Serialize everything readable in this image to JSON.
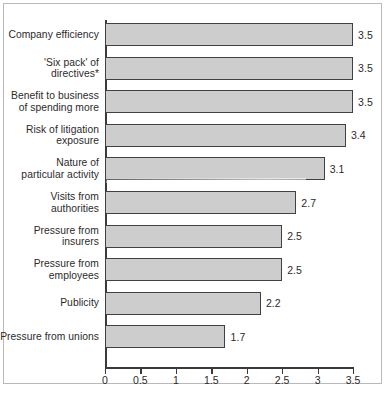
{
  "chart_data": {
    "type": "bar",
    "orientation": "horizontal",
    "title": "",
    "subtitle": "",
    "xlabel": "",
    "ylabel": "",
    "xlim": [
      0,
      3.5
    ],
    "xticks": [
      "0",
      "0.5",
      "1",
      "1.5",
      "2",
      "2.5",
      "3",
      "3.5"
    ],
    "xtick_values": [
      0,
      0.5,
      1,
      1.5,
      2,
      2.5,
      3,
      3.5
    ],
    "grid": false,
    "legend": null,
    "bar_fill_color": "#cdcdcd",
    "bar_edge_color": "#414141",
    "categories": [
      "Company efficiency",
      "'Six pack' of\ndirectives*",
      "Benefit to business\nof spending more",
      "Risk of litigation\nexposure",
      "Nature of\nparticular activity",
      "Visits from\nauthorities",
      "Pressure from\ninsurers",
      "Pressure from\nemployees",
      "Publicity",
      "Pressure from unions"
    ],
    "values": [
      3.5,
      3.5,
      3.5,
      3.4,
      3.1,
      2.7,
      2.5,
      2.5,
      2.2,
      1.7
    ],
    "value_labels": [
      "3.5",
      "3.5",
      "3.5",
      "3.4",
      "3.1",
      "2.7",
      "2.5",
      "2.5",
      "2.2",
      "1.7"
    ]
  },
  "caption": {
    "text": ""
  }
}
